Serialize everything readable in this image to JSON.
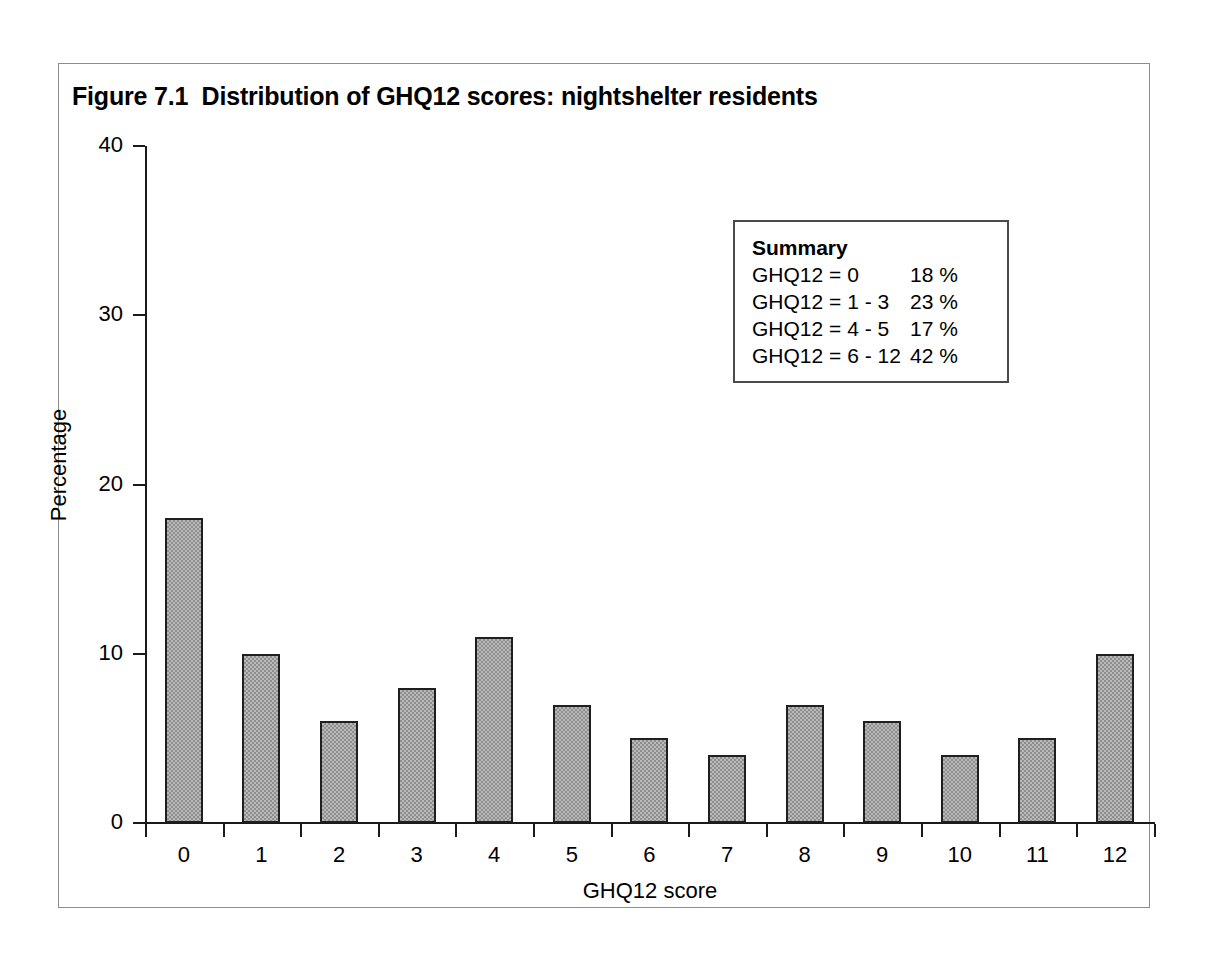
{
  "figure": {
    "title": "Figure 7.1  Distribution of GHQ12 scores: nightshelter residents"
  },
  "summary": {
    "heading": "Summary",
    "rows": [
      {
        "label": "GHQ12 = 0",
        "value": "18 %"
      },
      {
        "label": "GHQ12 = 1 - 3",
        "value": "23 %"
      },
      {
        "label": "GHQ12 = 4 - 5",
        "value": "17 %"
      },
      {
        "label": "GHQ12 = 6 - 12",
        "value": "42 %"
      }
    ]
  },
  "chart_data": {
    "type": "bar",
    "title": "Figure 7.1  Distribution of GHQ12 scores: nightshelter residents",
    "xlabel": "GHQ12 score",
    "ylabel": "Percentage",
    "categories": [
      "0",
      "1",
      "2",
      "3",
      "4",
      "5",
      "6",
      "7",
      "8",
      "9",
      "10",
      "11",
      "12"
    ],
    "values": [
      18,
      10,
      6,
      8,
      11,
      7,
      5,
      4,
      7,
      6,
      4,
      5,
      10
    ],
    "ylim": [
      0,
      40
    ],
    "yticks": [
      "0",
      "10",
      "20",
      "30",
      "40"
    ],
    "ytick_values": [
      0,
      10,
      20,
      30,
      40
    ],
    "grid": false,
    "legend": "none",
    "bar_fill": "#b9b9b9",
    "bar_edge": "#1f1f1f"
  }
}
